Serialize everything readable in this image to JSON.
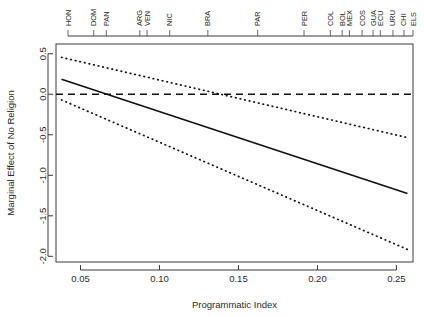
{
  "chart_data": {
    "type": "line",
    "title": "",
    "xlabel": "Programmatic Index",
    "ylabel": "Marginal Effect of No Religion",
    "xlim": [
      0.0345,
      0.2605
    ],
    "ylim": [
      -2.07,
      0.62
    ],
    "xticks": [
      0.05,
      0.1,
      0.15,
      0.2,
      0.25
    ],
    "xtick_labels": [
      "0.05",
      "0.10",
      "0.15",
      "0.20",
      "0.25"
    ],
    "yticks": [
      0.5,
      0.0,
      -0.5,
      -1.0,
      -1.5,
      -2.0
    ],
    "ytick_labels": [
      "0.5",
      "0.0",
      "-0.5",
      "-1.0",
      "-1.5",
      "-2.0"
    ],
    "grid": false,
    "legend": "none",
    "series": [
      {
        "name": "Marginal effect (point estimate)",
        "style": "solid",
        "x": [
          0.038,
          0.257
        ],
        "values": [
          0.185,
          -1.225
        ]
      },
      {
        "name": "Upper 95% confidence bound",
        "style": "dotted",
        "x": [
          0.038,
          0.257
        ],
        "values": [
          0.455,
          -0.535
        ]
      },
      {
        "name": "Lower 95% confidence bound",
        "style": "dotted",
        "x": [
          0.038,
          0.257
        ],
        "values": [
          -0.07,
          -1.915
        ]
      },
      {
        "name": "Zero reference line",
        "style": "dashed",
        "x": [
          0.0345,
          0.2605
        ],
        "values": [
          0.0,
          0.0
        ]
      }
    ],
    "annotations": {
      "rug_axis": "top",
      "rug_points": [
        {
          "label": "HON",
          "x": 0.0432
        },
        {
          "label": "DOM",
          "x": 0.0617
        },
        {
          "label": "PAN",
          "x": 0.0707
        },
        {
          "label": "ARG",
          "x": 0.0948
        },
        {
          "label": "VEN",
          "x": 0.1
        },
        {
          "label": "NIC",
          "x": 0.1163
        },
        {
          "label": "BRA",
          "x": 0.1437
        },
        {
          "label": "PAR",
          "x": 0.1795
        },
        {
          "label": "PER",
          "x": 0.2128
        },
        {
          "label": "COL",
          "x": 0.2317
        },
        {
          "label": "BOL",
          "x": 0.2402
        },
        {
          "label": "MEX",
          "x": 0.2454
        },
        {
          "label": "COS",
          "x": 0.2545
        },
        {
          "label": "GUA",
          "x": 0.2624
        },
        {
          "label": "ECU",
          "x": 0.2676
        },
        {
          "label": "URU",
          "x": 0.2767
        },
        {
          "label": "CHI",
          "x": 0.2846
        },
        {
          "label": "ELS",
          "x": 0.2911
        }
      ]
    },
    "colors": {
      "line": "#111111",
      "axis": "#3a3a3a",
      "background": "#ffffff"
    }
  }
}
